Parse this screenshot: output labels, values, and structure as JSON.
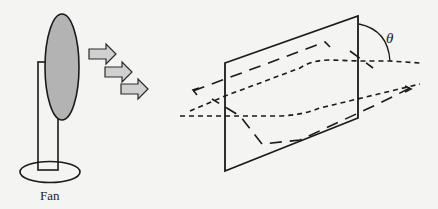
{
  "figure": {
    "fan_label": "Fan",
    "angle_label": "θ",
    "elements": {
      "fan": "fan-icon",
      "airflow": [
        "arrow-right-icon",
        "arrow-right-icon",
        "arrow-right-icon"
      ],
      "plate": "inclined-plate",
      "streamlines": "dashed-flow-lines"
    },
    "colors": {
      "fan_blade_fill": "#b3b3b3",
      "arrow_fill": "#d0d0d0",
      "stroke": "#1a1a1a",
      "background": "#f4f4f2"
    }
  }
}
